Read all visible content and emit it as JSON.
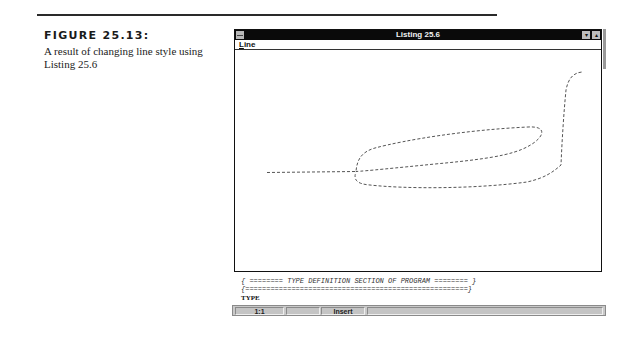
{
  "figure": {
    "title": "FIGURE 25.13:",
    "caption": "A result of changing line style using Listing 25.6"
  },
  "window": {
    "title": "Listing 25.6",
    "sysmenu_icon": "control-menu-box",
    "minimize_glyph": "▾",
    "maximize_glyph": "▴",
    "menu": [
      {
        "label_u": "L",
        "label_rest": "ine"
      }
    ],
    "drawing": {
      "line_style": "dashed",
      "stroke": "#555555"
    }
  },
  "code_lines": [
    "{ ======== TYPE DEFINITION SECTION OF PROGRAM ======== }",
    "{=====================================================}",
    "TYPE"
  ],
  "status_bar": {
    "position": "1:1",
    "blank": "",
    "mode": "Insert",
    "message": ""
  }
}
